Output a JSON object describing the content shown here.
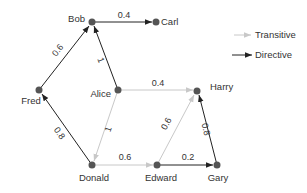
{
  "colors": {
    "node": "#555555",
    "directive": "#222222",
    "transitive": "#c8c8c8",
    "text": "#333333",
    "background": "#ffffff"
  },
  "legend": {
    "items": [
      {
        "label": "Transitive",
        "type": "transitive"
      },
      {
        "label": "Directive",
        "type": "directive"
      }
    ]
  },
  "nodes": [
    {
      "id": "Bob",
      "label": "Bob"
    },
    {
      "id": "Carl",
      "label": "Carl"
    },
    {
      "id": "Fred",
      "label": "Fred"
    },
    {
      "id": "Alice",
      "label": "Alice"
    },
    {
      "id": "Harry",
      "label": "Harry"
    },
    {
      "id": "Donald",
      "label": "Donald"
    },
    {
      "id": "Edward",
      "label": "Edward"
    },
    {
      "id": "Gary",
      "label": "Gary"
    }
  ],
  "edges": [
    {
      "from": "Bob",
      "to": "Carl",
      "weight": "0.4",
      "type": "directive"
    },
    {
      "from": "Fred",
      "to": "Bob",
      "weight": "0.6",
      "type": "directive"
    },
    {
      "from": "Alice",
      "to": "Bob",
      "weight": "1",
      "type": "directive"
    },
    {
      "from": "Alice",
      "to": "Harry",
      "weight": "0.4",
      "type": "transitive"
    },
    {
      "from": "Alice",
      "to": "Donald",
      "weight": "1",
      "type": "transitive"
    },
    {
      "from": "Donald",
      "to": "Fred",
      "weight": "0.8",
      "type": "directive"
    },
    {
      "from": "Donald",
      "to": "Edward",
      "weight": "0.6",
      "type": "transitive"
    },
    {
      "from": "Edward",
      "to": "Harry",
      "weight": "0.6",
      "type": "transitive"
    },
    {
      "from": "Edward",
      "to": "Gary",
      "weight": "0.2",
      "type": "directive"
    },
    {
      "from": "Gary",
      "to": "Harry",
      "weight": "0.8",
      "type": "directive"
    }
  ]
}
